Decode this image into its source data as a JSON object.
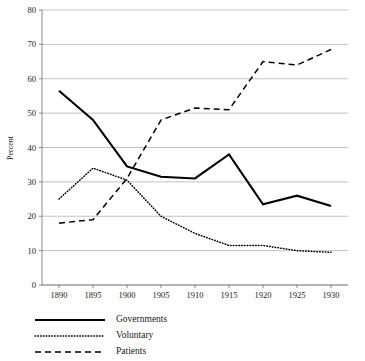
{
  "chart_data": {
    "type": "line",
    "title": "",
    "xlabel": "",
    "ylabel": "Percent",
    "x": [
      1890,
      1895,
      1900,
      1905,
      1910,
      1915,
      1920,
      1925,
      1930
    ],
    "xtick_labels": [
      "1890",
      "1895",
      "1900",
      "1905",
      "1910",
      "1915",
      "1920",
      "1925",
      "1930"
    ],
    "ytick_labels": [
      "0",
      "10",
      "20",
      "30",
      "40",
      "50",
      "60",
      "70",
      "80"
    ],
    "yticks": [
      0,
      10,
      20,
      30,
      40,
      50,
      60,
      70,
      80
    ],
    "xlim": [
      1887.5,
      1932.5
    ],
    "ylim": [
      0,
      80
    ],
    "grid": "horizontal",
    "legend_position": "below-left",
    "series": [
      {
        "name": "Governments",
        "style": "solid",
        "color": "#000000",
        "values": [
          56.5,
          48.0,
          34.5,
          31.5,
          31.0,
          38.0,
          23.5,
          26.0,
          23.0
        ]
      },
      {
        "name": "Voluntary",
        "style": "dotted",
        "color": "#000000",
        "values": [
          25.0,
          34.0,
          30.5,
          20.0,
          15.0,
          11.5,
          11.5,
          10.0,
          9.5
        ]
      },
      {
        "name": "Patients",
        "style": "dashed",
        "color": "#000000",
        "values": [
          18.0,
          19.0,
          31.0,
          48.0,
          51.5,
          51.0,
          65.0,
          64.0,
          68.5
        ]
      }
    ]
  },
  "legend": {
    "items": [
      {
        "label": "Governments",
        "style": "solid"
      },
      {
        "label": "Voluntary",
        "style": "dotted"
      },
      {
        "label": "Patients",
        "style": "dashed"
      }
    ]
  },
  "axes": {
    "y_title": "Percent"
  }
}
